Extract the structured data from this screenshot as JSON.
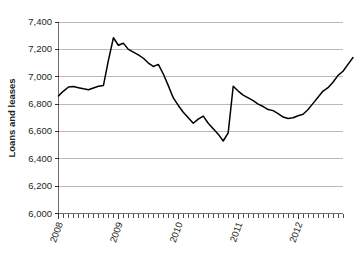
{
  "chart_data": {
    "type": "line",
    "title": "",
    "subtitle": "",
    "xlabel": "",
    "ylabel": "Loans and leases",
    "ylim": [
      6000,
      7400
    ],
    "ytick_labels": [
      "7,400",
      "7,200",
      "7,000",
      "6,800",
      "6,600",
      "6,400",
      "6,200",
      "6,000"
    ],
    "ytick_values": [
      7400,
      7200,
      7000,
      6800,
      6600,
      6400,
      6200,
      6000
    ],
    "ytick_interval": 200,
    "xtick_labels": [
      "2008",
      "2009",
      "2010",
      "2011",
      "2012"
    ],
    "xtick_values": [
      2008,
      2009,
      2010,
      2011,
      2012
    ],
    "xlim": [
      2008.0,
      2012.75
    ],
    "x_minor_tick_interval_months": 1,
    "grid": "horizontal",
    "legend": "none",
    "series": [
      {
        "name": "Loans and leases",
        "color": "#000000",
        "x": [
          2008.0,
          2008.083,
          2008.167,
          2008.25,
          2008.333,
          2008.417,
          2008.5,
          2008.583,
          2008.667,
          2008.75,
          2008.833,
          2008.917,
          2009.0,
          2009.083,
          2009.167,
          2009.25,
          2009.333,
          2009.417,
          2009.5,
          2009.583,
          2009.667,
          2009.75,
          2009.833,
          2009.917,
          2010.0,
          2010.083,
          2010.167,
          2010.25,
          2010.333,
          2010.417,
          2010.5,
          2010.583,
          2010.667,
          2010.75,
          2010.833,
          2010.917,
          2011.0,
          2011.083,
          2011.167,
          2011.25,
          2011.333,
          2011.417,
          2011.5,
          2011.583,
          2011.667,
          2011.75,
          2011.833,
          2011.917,
          2012.0,
          2012.083,
          2012.167,
          2012.25,
          2012.333,
          2012.417,
          2012.5,
          2012.583,
          2012.667
        ],
        "values": [
          6860,
          6895,
          6925,
          6928,
          6920,
          6912,
          6905,
          6918,
          6930,
          6935,
          7120,
          7285,
          7230,
          7245,
          7200,
          7180,
          7160,
          7135,
          7100,
          7075,
          7090,
          7020,
          6935,
          6845,
          6790,
          6740,
          6700,
          6660,
          6690,
          6712,
          6660,
          6620,
          6580,
          6530,
          6590,
          6930,
          6895,
          6865,
          6845,
          6825,
          6800,
          6782,
          6760,
          6752,
          6730,
          6705,
          6695,
          6700,
          6715,
          6725,
          6760,
          6805,
          6850,
          6895,
          6920,
          6960,
          7010
        ]
      }
    ],
    "series_tail": {
      "name": "Loans and leases continuation",
      "x": [
        2012.667,
        2012.75,
        2012.833,
        2012.917
      ],
      "values": [
        7010,
        7040,
        7090,
        7140
      ]
    },
    "peak_value": 7285,
    "trough_value": 6530,
    "start_value": 6860,
    "end_value": 7140
  },
  "colors": {
    "line": "#000000",
    "grid": "#a7a9ac",
    "axis": "#6d6e71",
    "text": "#231f20",
    "background": "#ffffff"
  }
}
